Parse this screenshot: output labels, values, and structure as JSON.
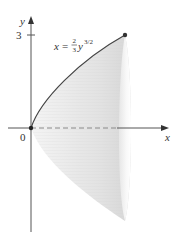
{
  "figure": {
    "axes": {
      "x_label": "x",
      "y_label": "y",
      "origin_label": "0",
      "y_tick_label": "3"
    },
    "curve": {
      "equation_lhs": "x",
      "equation_eq": "=",
      "frac_num": "2",
      "frac_den": "3",
      "equation_var": "y",
      "exponent": "3/2"
    },
    "colors": {
      "axis": "#555555",
      "curve": "#444444",
      "surface_light": "#ececec",
      "surface_mid": "#dcdcdc",
      "dash": "#888888"
    }
  }
}
